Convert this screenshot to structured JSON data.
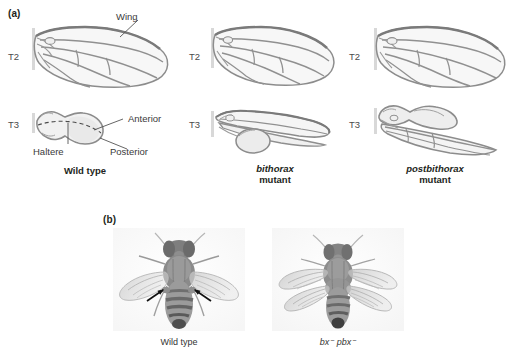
{
  "figure": {
    "title_panels": [
      "(a)",
      "(b)"
    ],
    "background_color": "#ffffff",
    "ink_color": "#231f20"
  },
  "panel_a": {
    "letter": "(a)",
    "segment_labels": {
      "t2": "T2",
      "t3": "T3"
    },
    "columns": [
      {
        "id": "wild-type",
        "caption_line1": "Wild type",
        "caption_line2": "",
        "caption_italic": false,
        "t2_structure": "wing",
        "t3_structure": "haltere",
        "annotations": [
          {
            "name": "wing",
            "text": "Wing"
          },
          {
            "name": "anterior",
            "text": "Anterior"
          },
          {
            "name": "posterior",
            "text": "Posterior"
          },
          {
            "name": "haltere",
            "text": "Haltere"
          }
        ]
      },
      {
        "id": "bithorax",
        "caption_line1": "bithorax",
        "caption_line2": "mutant",
        "caption_italic": true,
        "t2_structure": "wing",
        "t3_structure": "anterior-wing-posterior-haltere",
        "annotations": []
      },
      {
        "id": "postbithorax",
        "caption_line1": "postbithorax",
        "caption_line2": "mutant",
        "caption_italic": true,
        "t2_structure": "wing",
        "t3_structure": "anterior-haltere-posterior-wing",
        "annotations": []
      }
    ]
  },
  "panel_b": {
    "letter": "(b)",
    "photos": [
      {
        "id": "wild-type-fly",
        "caption": "Wild type",
        "caption_italic": false,
        "wing_pairs": 1,
        "arrow_count": 2,
        "arrow_target": "haltere",
        "description": "dorsal view of adult fly with two wings and halteres"
      },
      {
        "id": "bx-pbx-fly",
        "caption": "bx⁻ pbx⁻",
        "caption_italic": true,
        "wing_pairs": 2,
        "arrow_count": 0,
        "arrow_target": "",
        "description": "four-winged mutant fly, dorsal view"
      }
    ]
  },
  "colors": {
    "outline": "#8a8a8a",
    "outline_dark": "#6e6e6e",
    "fill_light": "#f4f4f4",
    "fill_mid": "#e8e8e8",
    "hinge": "#dcdcdc",
    "leader": "#555555",
    "dashed": "#4a4a4a",
    "photo_body": "#8d8d8d",
    "arrow": "#111111"
  }
}
